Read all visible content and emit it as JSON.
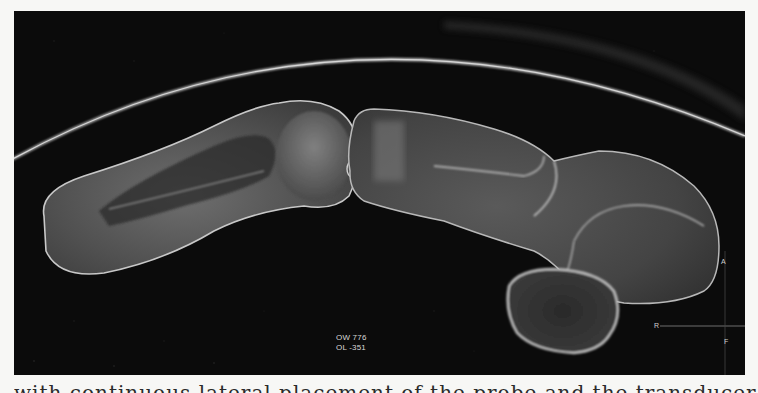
{
  "figure": {
    "type": "ultrasound-scan",
    "background_color": "#0b0b0b",
    "page_color": "#f7f7f5",
    "readout": {
      "line1": "OW 776",
      "line2": "OL  -351"
    },
    "orientation_markers": {
      "top": "A",
      "left": "R",
      "bottom": "F"
    }
  },
  "caption": {
    "text": "with continuous lateral placement of the probe and the transducer indicated"
  }
}
